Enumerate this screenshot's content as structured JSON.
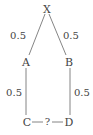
{
  "diagram": {
    "type": "tree",
    "nodes": {
      "X": {
        "label": "X",
        "x": 47,
        "y": 10
      },
      "A": {
        "label": "A",
        "x": 26,
        "y": 63
      },
      "B": {
        "label": "B",
        "x": 69,
        "y": 63
      },
      "C": {
        "label": "C",
        "x": 25,
        "y": 123
      },
      "D": {
        "label": "D",
        "x": 70,
        "y": 123
      }
    },
    "edges": [
      {
        "from": "X",
        "to": "A",
        "label": "0.5"
      },
      {
        "from": "X",
        "to": "B",
        "label": "0.5"
      },
      {
        "from": "A",
        "to": "C",
        "label": "0.5"
      },
      {
        "from": "B",
        "to": "D",
        "label": "0.5"
      },
      {
        "from": "C",
        "to": "D",
        "label": "?"
      }
    ],
    "colors": {
      "line": "#777777",
      "text": "#444444",
      "background": "#ffffff"
    }
  }
}
